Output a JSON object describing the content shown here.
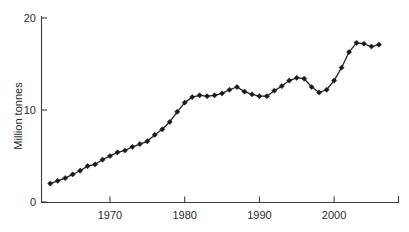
{
  "chart_data": {
    "type": "line",
    "title": "",
    "subtitle": "",
    "xlabel": "",
    "ylabel": "Million tonnes",
    "xlim": [
      1962,
      2006.5
    ],
    "ylim": [
      0,
      20
    ],
    "grid": false,
    "legend": "none",
    "marker": "diamond",
    "line_color": "#242424",
    "marker_color": "#1b1b1b",
    "axis_color": "#3d3d3d",
    "x_ticks": [
      1970,
      1980,
      1990,
      2000
    ],
    "x_tick_labels": [
      "1970",
      "1980",
      "1990",
      "2000"
    ],
    "y_ticks": [
      0,
      10,
      20
    ],
    "y_tick_labels": [
      "0",
      "10",
      "20"
    ],
    "series": [
      {
        "name": "",
        "x": [
          1962,
          1963,
          1964,
          1965,
          1966,
          1967,
          1968,
          1969,
          1970,
          1971,
          1972,
          1973,
          1974,
          1975,
          1976,
          1977,
          1978,
          1979,
          1980,
          1981,
          1982,
          1983,
          1984,
          1985,
          1986,
          1987,
          1988,
          1989,
          1990,
          1991,
          1992,
          1993,
          1994,
          1995,
          1996,
          1997,
          1998,
          1999,
          2000,
          2001,
          2002,
          2003,
          2004,
          2005,
          2006
        ],
        "values": [
          2.0,
          2.3,
          2.6,
          3.0,
          3.4,
          3.9,
          4.1,
          4.6,
          5.0,
          5.4,
          5.6,
          6.0,
          6.3,
          6.6,
          7.3,
          7.9,
          8.7,
          9.8,
          10.8,
          11.4,
          11.6,
          11.5,
          11.6,
          11.8,
          12.2,
          12.5,
          12.0,
          11.7,
          11.5,
          11.5,
          12.1,
          12.6,
          13.2,
          13.5,
          13.4,
          12.5,
          11.9,
          12.2,
          13.2,
          14.6,
          16.3,
          17.3,
          17.2,
          16.9,
          17.1
        ]
      }
    ]
  }
}
